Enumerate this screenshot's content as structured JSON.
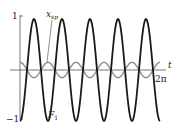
{
  "chart_data": {
    "type": "line",
    "title": "",
    "xlabel": "t",
    "ylabel": "",
    "xlim": [
      0,
      6.2832
    ],
    "ylim": [
      -1,
      1
    ],
    "grid": false,
    "legend": "inline annotations",
    "x_tick_labels": [
      "2π"
    ],
    "y_tick_labels": [
      "1",
      "−1"
    ],
    "series": [
      {
        "name": "F₁",
        "label_main": "F",
        "label_sub": "1",
        "color": "#1a1a1a",
        "formula": "-cos(5t)",
        "amplitude": 1.0,
        "periods": 5
      },
      {
        "name": "x_sp",
        "label_main": "x",
        "label_sub": "sp",
        "color": "#8c8c8c",
        "formula": "0.15·cos(5t)",
        "amplitude": 0.15,
        "periods": 5
      }
    ]
  },
  "axes": {
    "y_top_label": "1",
    "y_bottom_label": "−1",
    "x_axis_label": "t",
    "x_end_label": "2π"
  }
}
